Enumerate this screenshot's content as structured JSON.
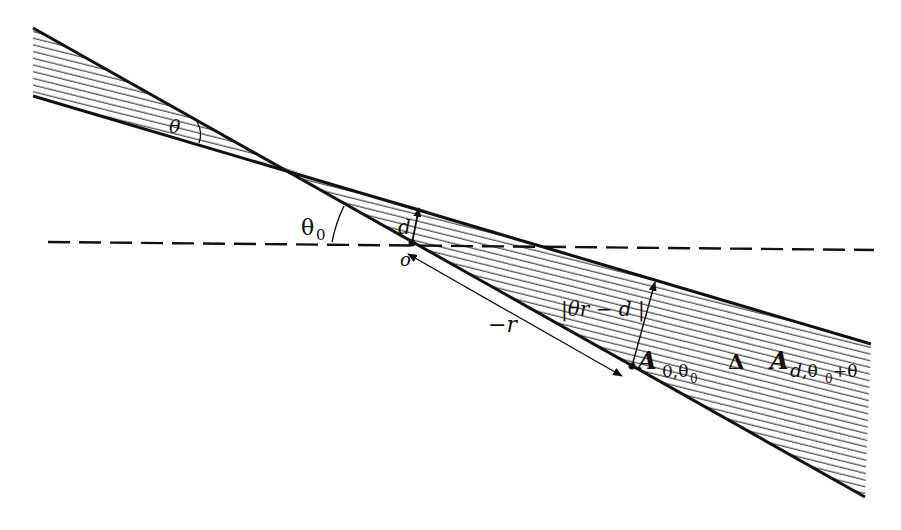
{
  "diagram": {
    "type": "geometric-figure",
    "colors": {
      "ink": "#111111",
      "hatch": "#333333",
      "background": "#ffffff"
    },
    "labels": {
      "theta": "θ",
      "theta0": "θ",
      "theta0_sub": "0",
      "d": "d",
      "origin": "o",
      "minus_r": "−r",
      "distance": "|θr − d |",
      "A1": "A",
      "A1_sub": "0,θ",
      "A1_subsub": "0",
      "delta": "Δ",
      "A2": "A",
      "A2_sub": "d",
      "A2_sub2": ",θ",
      "A2_subsub": "0",
      "A2_sub3": "+θ"
    },
    "geometry": {
      "line_steep": {
        "from": [
          33,
          28
        ],
        "to": [
          865,
          497
        ]
      },
      "line_shallow": {
        "from": [
          33,
          96
        ],
        "to": [
          871,
          344
        ]
      },
      "crossing_point": [
        272,
        164
      ],
      "origin_point": [
        412,
        243
      ],
      "dashed_line": {
        "from": [
          48,
          242
        ],
        "to": [
          874,
          250
        ]
      },
      "point_A": [
        632,
        366
      ]
    }
  }
}
